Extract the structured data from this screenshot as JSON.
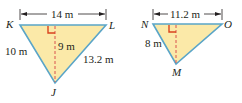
{
  "colors": {
    "fill": "#fbe9a8",
    "edge": "#5aa5c8",
    "height_line": "#d9534f",
    "right_angle": "#d9431e",
    "dimension": "#231f20"
  },
  "triangle_left": {
    "vertices": {
      "top_left": "K",
      "top_right": "L",
      "bottom": "J"
    },
    "base_label": "14 m",
    "height_label": "9 m",
    "left_side_label": "10 m",
    "right_side_label": "13.2 m"
  },
  "triangle_right": {
    "vertices": {
      "top_left": "N",
      "top_right": "O",
      "bottom": "M"
    },
    "base_label": "11.2 m",
    "left_side_label": "8 m"
  }
}
